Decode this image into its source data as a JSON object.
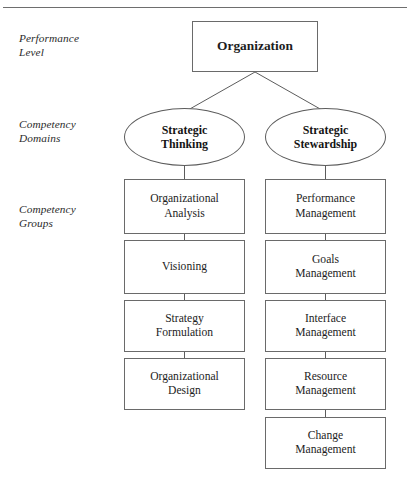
{
  "figure": {
    "style": {
      "line_color": "#5c5c5c",
      "box_border": "#6a6a6a",
      "text_color": "#1d1d1d",
      "background": "#ffffff"
    }
  },
  "row_labels": [
    {
      "id": "performance-level",
      "text": "Performance\nLevel"
    },
    {
      "id": "competency-domains",
      "text": "Competency\nDomains"
    },
    {
      "id": "competency-groups",
      "text": "Competency\nGroups"
    }
  ],
  "nodes": {
    "root": {
      "label": "Organization"
    },
    "domains": [
      {
        "id": "strategic-thinking",
        "label": "Strategic\nThinking"
      },
      {
        "id": "strategic-stewardship",
        "label": "Strategic\nStewardship"
      }
    ],
    "groups_left": [
      {
        "id": "organizational-analysis",
        "label": "Organizational\nAnalysis"
      },
      {
        "id": "visioning",
        "label": "Visioning"
      },
      {
        "id": "strategy-formulation",
        "label": "Strategy\nFormulation"
      },
      {
        "id": "organizational-design",
        "label": "Organizational\nDesign"
      }
    ],
    "groups_right": [
      {
        "id": "performance-management",
        "label": "Performance\nManagement"
      },
      {
        "id": "goals-management",
        "label": "Goals\nManagement"
      },
      {
        "id": "interface-management",
        "label": "Interface\nManagement"
      },
      {
        "id": "resource-management",
        "label": "Resource\nManagement"
      },
      {
        "id": "change-management",
        "label": "Change\nManagement"
      }
    ]
  }
}
